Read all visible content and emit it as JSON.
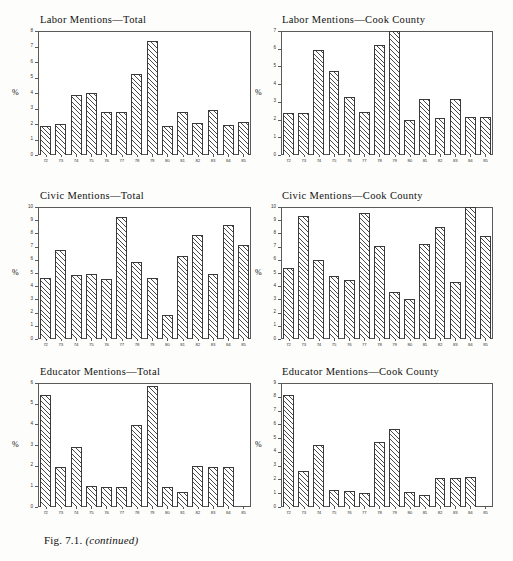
{
  "caption": {
    "figure_number": "Fig. 7.1.",
    "note": "(continued)"
  },
  "axis": {
    "ylabel": "%"
  },
  "chart_data": [
    {
      "type": "bar",
      "title": "Labor Mentions—Total",
      "xlabel": "",
      "ylabel": "%",
      "ylim": [
        0,
        8
      ],
      "yticks": [
        "0",
        "1",
        "2",
        "3",
        "4",
        "5",
        "6",
        "7",
        "8"
      ],
      "grid": false,
      "categories": [
        "72",
        "73",
        "74",
        "75",
        "76",
        "77",
        "78",
        "79",
        "80",
        "81",
        "82",
        "83",
        "84",
        "85"
      ],
      "values": [
        1.85,
        2.0,
        3.85,
        4.0,
        2.75,
        2.8,
        5.25,
        7.35,
        1.85,
        2.8,
        2.05,
        2.9,
        1.95,
        2.1
      ]
    },
    {
      "type": "bar",
      "title": "Labor Mentions—Cook County",
      "xlabel": "",
      "ylabel": "%",
      "ylim": [
        0,
        7
      ],
      "yticks": [
        "0",
        "1",
        "2",
        "3",
        "4",
        "5",
        "6",
        "7"
      ],
      "grid": false,
      "categories": [
        "72",
        "73",
        "74",
        "75",
        "76",
        "77",
        "78",
        "79",
        "80",
        "81",
        "82",
        "83",
        "84",
        "85"
      ],
      "values": [
        2.4,
        2.35,
        5.95,
        4.75,
        3.3,
        2.45,
        6.2,
        7.0,
        2.0,
        3.15,
        2.1,
        3.15,
        2.15,
        2.15
      ]
    },
    {
      "type": "bar",
      "title": "Civic Mentions—Total",
      "xlabel": "",
      "ylabel": "%",
      "ylim": [
        0,
        10
      ],
      "yticks": [
        "0",
        "1",
        "2",
        "3",
        "4",
        "5",
        "6",
        "7",
        "8",
        "9",
        "10"
      ],
      "grid": false,
      "categories": [
        "72",
        "73",
        "74",
        "75",
        "76",
        "77",
        "78",
        "79",
        "80",
        "81",
        "82",
        "83",
        "84",
        "85"
      ],
      "values": [
        4.65,
        6.75,
        4.85,
        4.95,
        4.55,
        9.25,
        5.85,
        4.65,
        1.85,
        6.3,
        7.9,
        4.95,
        8.65,
        7.1
      ]
    },
    {
      "type": "bar",
      "title": "Civic Mentions—Cook County",
      "xlabel": "",
      "ylabel": "%",
      "ylim": [
        0,
        10
      ],
      "yticks": [
        "0",
        "1",
        "2",
        "3",
        "4",
        "5",
        "6",
        "7",
        "8",
        "9",
        "10"
      ],
      "grid": false,
      "categories": [
        "72",
        "73",
        "74",
        "75",
        "76",
        "77",
        "78",
        "79",
        "80",
        "81",
        "82",
        "83",
        "84",
        "85"
      ],
      "values": [
        5.35,
        9.35,
        6.0,
        4.8,
        4.5,
        9.55,
        7.05,
        3.55,
        3.05,
        7.2,
        8.5,
        4.3,
        10.0,
        7.8
      ]
    },
    {
      "type": "bar",
      "title": "Educator Mentions—Total",
      "xlabel": "",
      "ylabel": "%",
      "ylim": [
        0,
        6
      ],
      "yticks": [
        "0",
        "1",
        "2",
        "3",
        "4",
        "5",
        "6"
      ],
      "grid": false,
      "categories": [
        "72",
        "73",
        "74",
        "75",
        "76",
        "77",
        "78",
        "79",
        "80",
        "81",
        "82",
        "83",
        "84",
        "85"
      ],
      "values": [
        5.4,
        1.95,
        2.9,
        1.0,
        0.95,
        0.95,
        3.95,
        5.85,
        0.95,
        0.75,
        2.0,
        1.95,
        1.95,
        0.0
      ]
    },
    {
      "type": "bar",
      "title": "Educator Mentions—Cook County",
      "xlabel": "",
      "ylabel": "%",
      "ylim": [
        0,
        9
      ],
      "yticks": [
        "0",
        "1",
        "2",
        "3",
        "4",
        "5",
        "6",
        "7",
        "8",
        "9"
      ],
      "grid": false,
      "categories": [
        "72",
        "73",
        "74",
        "75",
        "76",
        "77",
        "78",
        "79",
        "80",
        "81",
        "82",
        "83",
        "84",
        "85"
      ],
      "values": [
        8.15,
        2.65,
        4.5,
        1.2,
        1.15,
        1.0,
        4.75,
        5.65,
        1.1,
        0.9,
        2.1,
        2.1,
        2.2,
        0.0
      ]
    }
  ],
  "layout": {
    "panels": [
      {
        "left": 26,
        "top": 14,
        "plot_left": 38,
        "plot_top": 31,
        "plot_w": 213,
        "plot_h": 124
      },
      {
        "left": 268,
        "top": 14,
        "plot_left": 281,
        "plot_top": 31,
        "plot_w": 212,
        "plot_h": 124
      },
      {
        "left": 26,
        "top": 190,
        "plot_left": 38,
        "plot_top": 207,
        "plot_w": 213,
        "plot_h": 132
      },
      {
        "left": 268,
        "top": 190,
        "plot_left": 281,
        "plot_top": 207,
        "plot_w": 212,
        "plot_h": 132
      },
      {
        "left": 26,
        "top": 366,
        "plot_left": 38,
        "plot_top": 383,
        "plot_w": 213,
        "plot_h": 124
      },
      {
        "left": 268,
        "top": 366,
        "plot_left": 281,
        "plot_top": 383,
        "plot_w": 212,
        "plot_h": 124
      }
    ]
  }
}
